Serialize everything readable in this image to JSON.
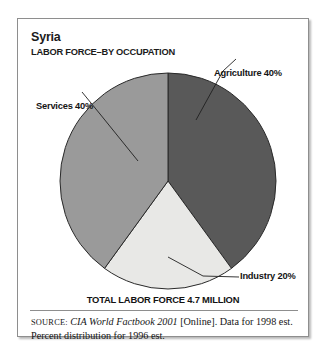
{
  "figure": {
    "title": "Syria",
    "subtitle": "LABOR FORCE–BY OCCUPATION",
    "total_caption": "TOTAL LABOR FORCE 4.7 MILLION",
    "source": {
      "label": "SOURCE:",
      "work": "CIA World Factbook 2001",
      "rest": " [Online]. Data for 1998 est. Percent distribution for 1996 est."
    }
  },
  "chart_data": {
    "type": "pie",
    "title": "Syria",
    "subtitle": "LABOR FORCE–BY OCCUPATION",
    "unit": "percent",
    "total_label": "TOTAL LABOR FORCE 4.7 MILLION",
    "total_value": 4.7,
    "total_unit": "million workers",
    "categories": [
      "Agriculture",
      "Industry",
      "Services"
    ],
    "values": [
      40,
      20,
      40
    ],
    "labels": [
      "Agriculture 40%",
      "Industry 20%",
      "Services 40%"
    ],
    "colors": [
      "#595959",
      "#e8e8e6",
      "#9a9a9a"
    ],
    "start_angle_deg": 0,
    "direction": "clockwise",
    "legend": "callout-labels",
    "grid": false,
    "slices": [
      {
        "name": "Agriculture",
        "value": 40,
        "label": "Agriculture 40%",
        "color": "#595959",
        "start_deg": 0,
        "end_deg": 144
      },
      {
        "name": "Industry",
        "value": 20,
        "label": "Industry 20%",
        "color": "#e8e8e6",
        "start_deg": 144,
        "end_deg": 216
      },
      {
        "name": "Services",
        "value": 40,
        "label": "Services 40%",
        "color": "#9a9a9a",
        "start_deg": 216,
        "end_deg": 360
      }
    ]
  }
}
